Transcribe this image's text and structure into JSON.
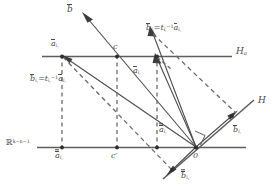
{
  "figure": {
    "kind": "geometric-diagram",
    "background": "#ffffff",
    "stroke_color": "#5a5a5a",
    "dash_color": "#6a6a6a",
    "text_color": "#4a4a4a",
    "width": 277,
    "height": 189
  },
  "labels": {
    "b_hat": "b",
    "c_upper": "c",
    "c_lower": "c′",
    "H_a": "H",
    "H_a_sub": "a",
    "H": "H",
    "origin": "0",
    "real_space": "ℝ",
    "real_space_exp": "k−n−1",
    "a_bar_i1_upper": "a",
    "a_bar_i1_upper_sub": "i",
    "a_bar_i1_upper_sub2": "1",
    "a_bar_ir_mid": "a",
    "a_bar_ir_mid_sub": "i",
    "a_bar_ir_mid_sub2": "r",
    "a_dbar_i1_lower": "a",
    "a_dbar_i1_lower_sub": "i",
    "a_dbar_i1_lower_sub2": "1",
    "a_dbar_ir_lower": "a",
    "a_dbar_ir_lower_sub": "i",
    "a_dbar_ir_lower_sub2": "r",
    "b_dbar_i1_bottom": "b",
    "b_dbar_i1_bottom_sub": "i",
    "b_dbar_i1_bottom_sub2": "1",
    "b_bar_ir_right": "b",
    "b_bar_ir_right_sub": "i",
    "b_bar_ir_right_sub2": "r",
    "eq_i1": {
      "lhs": "b",
      "lhs_sub": "i",
      "lhs_sub2": "1",
      "eq": "=",
      "t": "t",
      "t_sub": "i",
      "t_sub2": "1",
      "t_sup": "−1",
      "rhs": "a",
      "rhs_sub": "i",
      "rhs_sub2": "1"
    },
    "eq_ir": {
      "lhs": "b",
      "lhs_sub": "i",
      "lhs_sub2": "r",
      "eq": "=",
      "t": "t",
      "t_sub": "i",
      "t_sub2": "r",
      "t_sup": "−1",
      "rhs": "a",
      "rhs_sub": "i",
      "rhs_sub2": "r"
    }
  }
}
